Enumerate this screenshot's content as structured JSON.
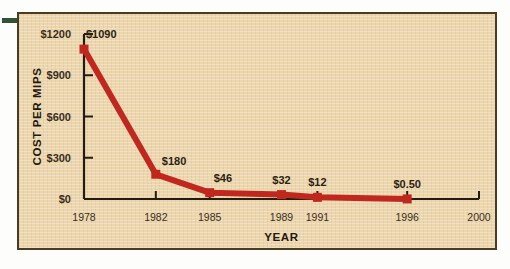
{
  "figure": {
    "background_color": "#ecd6ad",
    "frame_color": "#4b3b22",
    "accent_color": "#c0271e",
    "text_color": "#2c2212",
    "marker_artifact": "green-dash"
  },
  "chart_data": {
    "type": "line",
    "title": "",
    "xlabel": "YEAR",
    "ylabel": "COST PER MIPS",
    "x": [
      "1978",
      "1982",
      "1985",
      "1989",
      "1991",
      "1996"
    ],
    "values": [
      1090,
      180,
      46,
      32,
      12,
      0.5
    ],
    "point_labels": [
      "$1090",
      "$180",
      "$46",
      "$32",
      "$12",
      "$0.50"
    ],
    "xtick_labels": [
      "1978",
      "1982",
      "1985",
      "1989",
      "1991",
      "1996",
      "2000"
    ],
    "ytick_labels": [
      "$0",
      "$300",
      "$600",
      "$900",
      "$1200"
    ],
    "ytick_values": [
      0,
      300,
      600,
      900,
      1200
    ],
    "ylim": [
      0,
      1200
    ],
    "xlim": [
      1978,
      2000
    ],
    "grid": false,
    "legend": "none",
    "series_color": "#c0271e",
    "marker": "square"
  }
}
